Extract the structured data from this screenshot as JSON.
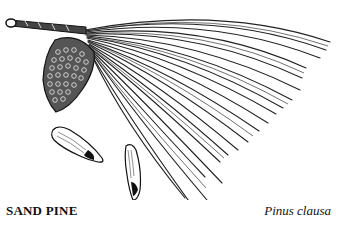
{
  "figure": {
    "elements": [
      "twig-icon",
      "pine-cone-icon",
      "pine-needles-icon",
      "winged-seed-icon",
      "winged-seed-icon"
    ]
  },
  "caption": {
    "common_name": "SAND PINE",
    "scientific_name": "Pinus clausa"
  },
  "colors": {
    "ink": "#111111",
    "background": "#ffffff"
  }
}
